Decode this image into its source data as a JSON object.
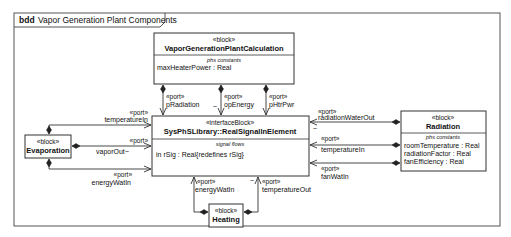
{
  "frame": {
    "kind": "bdd",
    "title": "Vapor Generation Plant Components"
  },
  "blocks": {
    "calculation": {
      "stereotype": "«block»",
      "name": "VaporGenerationPlantCalculation",
      "compartment_label": "phs constants",
      "properties": [
        "maxHeaterPower : Real"
      ]
    },
    "interface": {
      "stereotype": "«interfaceBlock»",
      "name": "SysPhSLibrary::RealSignalInElement",
      "compartment_label": "signal flows",
      "properties": [
        "in rSig : Real{redefines  rSig}"
      ]
    },
    "evaporation": {
      "stereotype": "«block»",
      "name": "Evaporation"
    },
    "heating": {
      "stereotype": "«block»",
      "name": "Heating"
    },
    "radiation": {
      "stereotype": "«block»",
      "name": "Radiation",
      "compartment_label": "phs constants",
      "properties": [
        "roomTemperature  : Real",
        "radiationFactor : Real",
        "fanEfficiency : Real"
      ]
    }
  },
  "ports": {
    "stereotype": "«port»",
    "pRadiation": "pRadiation",
    "opEnergy": "opEnergy",
    "pHtrPwr": "pHtrPwr",
    "evap_temperatureIn": "temperatureIn",
    "evap_vaporOut": "vaporOut",
    "evap_energyWatIn": "energyWatIn",
    "heat_energyWatIn": "energyWatIn",
    "heat_temperatureOut": "temperatureOut",
    "rad_radiationWaterOut": "radiationWaterOut",
    "rad_temperatureIn": "temperatureIn",
    "rad_fanWatIn": "fanWatIn",
    "conjugate_mark": "~"
  }
}
